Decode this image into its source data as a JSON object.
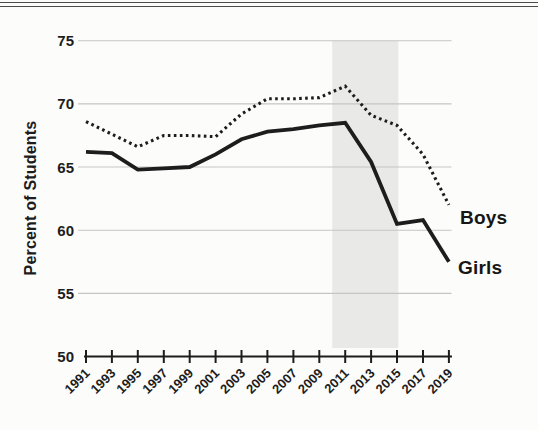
{
  "chart_data": {
    "type": "line",
    "title": "",
    "ylabel": "Percent of Students",
    "xlabel": "",
    "ylim": [
      50,
      75
    ],
    "yticks": [
      50,
      55,
      60,
      65,
      70,
      75
    ],
    "x": [
      1991,
      1993,
      1995,
      1997,
      1999,
      2001,
      2003,
      2005,
      2007,
      2009,
      2011,
      2013,
      2015,
      2017,
      2019
    ],
    "series": [
      {
        "name": "Boys",
        "style": "dotted",
        "values": [
          68.6,
          67.6,
          66.6,
          67.5,
          67.5,
          67.4,
          69.2,
          70.4,
          70.4,
          70.5,
          71.4,
          69.1,
          68.3,
          66.0,
          62.0
        ]
      },
      {
        "name": "Girls",
        "style": "solid",
        "values": [
          66.2,
          66.1,
          64.8,
          64.9,
          65.0,
          66.0,
          67.2,
          67.8,
          68.0,
          68.3,
          68.5,
          65.4,
          60.5,
          60.8,
          57.5
        ]
      }
    ],
    "highlight_band": {
      "x_start": 2010,
      "x_end": 2015.1,
      "color": "#e9e9e8"
    },
    "grid": true,
    "legend_position": "line-end-labels",
    "colors": {
      "line": "#1d1d1d",
      "grid": "#c5c5c3",
      "text": "#1d1d1d",
      "background": "#fcfcfa"
    }
  }
}
